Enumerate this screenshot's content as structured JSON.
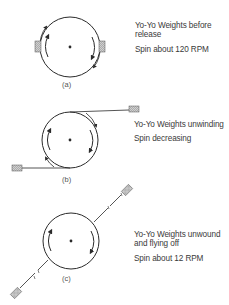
{
  "panels": [
    {
      "id": "a",
      "caption": "(a)",
      "title": "Yo-Yo Weights before release",
      "title_line1": "Yo-Yo Weights before",
      "title_line2": "release",
      "spin": "Spin about 120 RPM"
    },
    {
      "id": "b",
      "caption": "(b)",
      "title": "Yo-Yo Weights unwinding",
      "spin": "Spin decreasing"
    },
    {
      "id": "c",
      "caption": "(c)",
      "title": "Yo-Yo Weights unwound and flying off",
      "title_line1": "Yo-Yo Weights unwound",
      "title_line2": "and flying off",
      "spin": "Spin about 12 RPM"
    }
  ],
  "colors": {
    "line": "#2a2a2a",
    "weight_fill": "#bdbdbd",
    "text": "#3a3a3a"
  }
}
